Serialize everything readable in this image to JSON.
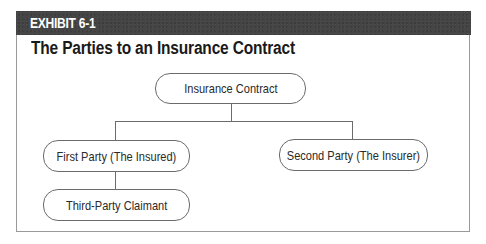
{
  "exhibit": {
    "label": "EXHIBIT 6-1",
    "title": "The Parties to an Insurance Contract",
    "header_color": "#454545"
  },
  "diagram": {
    "root": {
      "label": "Insurance Contract"
    },
    "children": [
      {
        "label": "First Party (The Insured)",
        "children": [
          {
            "label": "Third-Party Claimant"
          }
        ]
      },
      {
        "label": "Second Party (The Insurer)"
      }
    ],
    "line_color": "#6b6b6b"
  }
}
